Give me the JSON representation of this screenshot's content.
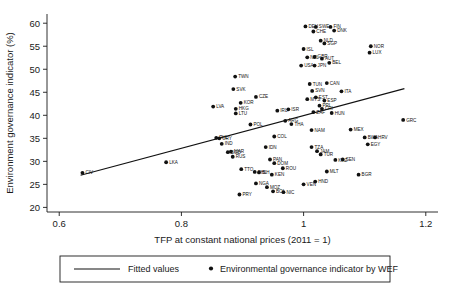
{
  "chart_data": {
    "type": "scatter",
    "title": "",
    "xlabel": "TFP at constant national prices (2011 = 1)",
    "ylabel": "Environment governance indicator (%)",
    "xlim": [
      0.58,
      1.22
    ],
    "ylim": [
      19,
      62
    ],
    "xticks": [
      "0.6",
      "0.8",
      "1",
      "1.2"
    ],
    "xtick_values": [
      0.6,
      0.8,
      1.0,
      1.2
    ],
    "yticks": [
      "20",
      "25",
      "30",
      "35",
      "40",
      "45",
      "50",
      "55",
      "60"
    ],
    "ytick_values": [
      20,
      25,
      30,
      35,
      40,
      45,
      50,
      55,
      60
    ],
    "grid": false,
    "legend_position": "below",
    "legend": [
      {
        "marker": "line",
        "label": "Fitted values"
      },
      {
        "marker": "dot",
        "label": "Environmental governance indicator by WEF"
      }
    ],
    "fitted_line": {
      "x0": 0.635,
      "y0": 27.0,
      "x1": 1.165,
      "y1": 45.8
    },
    "points": [
      {
        "label": "CIV",
        "x": 0.638,
        "y": 27.5,
        "dx": 3,
        "dy": 1.6
      },
      {
        "label": "LKA",
        "x": 0.775,
        "y": 29.8,
        "dx": 3,
        "dy": 1.6
      },
      {
        "label": "LVA",
        "x": 0.852,
        "y": 41.9,
        "dx": 3,
        "dy": 1.6
      },
      {
        "label": "TWN",
        "x": 0.888,
        "y": 48.4,
        "dx": 3,
        "dy": 1.6
      },
      {
        "label": "SVK",
        "x": 0.885,
        "y": 45.7,
        "dx": 3,
        "dy": 1.6
      },
      {
        "label": "CZE",
        "x": 0.922,
        "y": 44.0,
        "dx": 3,
        "dy": 1.6
      },
      {
        "label": "KOR",
        "x": 0.897,
        "y": 42.7,
        "dx": 3,
        "dy": 1.6
      },
      {
        "label": "HKG",
        "x": 0.889,
        "y": 41.4,
        "dx": 3,
        "dy": 1.6
      },
      {
        "label": "LTU",
        "x": 0.889,
        "y": 40.4,
        "dx": 3,
        "dy": 1.6
      },
      {
        "label": "POL",
        "x": 0.913,
        "y": 38.0,
        "dx": 3,
        "dy": 1.6
      },
      {
        "label": "URY",
        "x": 0.862,
        "y": 35.0,
        "dx": 3,
        "dy": 1.6
      },
      {
        "label": "PHL",
        "x": 0.857,
        "y": 35.1,
        "dx": 3,
        "dy": 1.6
      },
      {
        "label": "IND",
        "x": 0.866,
        "y": 33.8,
        "dx": 3,
        "dy": 1.6
      },
      {
        "label": "MAR",
        "x": 0.881,
        "y": 32.1,
        "dx": 3,
        "dy": 1.6
      },
      {
        "label": "BGD",
        "x": 0.876,
        "y": 32.0,
        "dx": 3,
        "dy": 1.6
      },
      {
        "label": "RUS",
        "x": 0.884,
        "y": 31.0,
        "dx": 3,
        "dy": 1.6
      },
      {
        "label": "TTO",
        "x": 0.898,
        "y": 28.3,
        "dx": 3,
        "dy": 1.6
      },
      {
        "label": "PHL2",
        "x": 0.92,
        "y": 27.7,
        "dx": 3,
        "dy": 1.6
      },
      {
        "label": "BIH",
        "x": 0.927,
        "y": 27.6,
        "dx": 3,
        "dy": 1.6
      },
      {
        "label": "NGA",
        "x": 0.922,
        "y": 25.2,
        "dx": 3,
        "dy": 1.6
      },
      {
        "label": "MOZ",
        "x": 0.94,
        "y": 24.4,
        "dx": 3,
        "dy": 1.6
      },
      {
        "label": "PRY",
        "x": 0.895,
        "y": 22.8,
        "dx": 3,
        "dy": 1.6
      },
      {
        "label": "BOL",
        "x": 0.95,
        "y": 23.5,
        "dx": 3,
        "dy": 1.6
      },
      {
        "label": "NIC",
        "x": 0.967,
        "y": 23.3,
        "dx": 3,
        "dy": 1.6
      },
      {
        "label": "IDN",
        "x": 0.938,
        "y": 33.1,
        "dx": 3,
        "dy": 1.6
      },
      {
        "label": "COL",
        "x": 0.952,
        "y": 35.4,
        "dx": 3,
        "dy": 1.6
      },
      {
        "label": "PAN",
        "x": 0.945,
        "y": 30.4,
        "dx": 3,
        "dy": 1.6
      },
      {
        "label": "DOM",
        "x": 0.952,
        "y": 29.6,
        "dx": 3,
        "dy": 1.6
      },
      {
        "label": "ROU",
        "x": 0.966,
        "y": 28.5,
        "dx": 3,
        "dy": 1.6
      },
      {
        "label": "KEN",
        "x": 0.948,
        "y": 27.1,
        "dx": 3,
        "dy": 1.6
      },
      {
        "label": "IRL",
        "x": 0.957,
        "y": 41.0,
        "dx": 3,
        "dy": 1.6
      },
      {
        "label": "ISR",
        "x": 0.975,
        "y": 41.3,
        "dx": 3,
        "dy": 1.6
      },
      {
        "label": "ARG",
        "x": 0.97,
        "y": 38.8,
        "dx": 3,
        "dy": 1.6
      },
      {
        "label": "THA",
        "x": 0.98,
        "y": 38.1,
        "dx": 3,
        "dy": 1.6
      },
      {
        "label": "TUN",
        "x": 1.01,
        "y": 46.8,
        "dx": 3,
        "dy": 1.6
      },
      {
        "label": "CAN",
        "x": 1.038,
        "y": 47.0,
        "dx": 3,
        "dy": 1.6
      },
      {
        "label": "SVN",
        "x": 1.014,
        "y": 45.3,
        "dx": 3,
        "dy": 1.6
      },
      {
        "label": "ITA",
        "x": 1.062,
        "y": 45.2,
        "dx": 3,
        "dy": 1.6
      },
      {
        "label": "MYS",
        "x": 1.006,
        "y": 43.5,
        "dx": 3,
        "dy": 1.6
      },
      {
        "label": "EST",
        "x": 1.02,
        "y": 43.9,
        "dx": 3,
        "dy": 1.6
      },
      {
        "label": "ESP",
        "x": 1.034,
        "y": 43.2,
        "dx": 3,
        "dy": 1.6
      },
      {
        "label": "PRI",
        "x": 1.026,
        "y": 42.1,
        "dx": 3,
        "dy": 1.6
      },
      {
        "label": "CRI",
        "x": 1.03,
        "y": 41.4,
        "dx": 3,
        "dy": 1.6
      },
      {
        "label": "HUN",
        "x": 1.046,
        "y": 40.5,
        "dx": 3,
        "dy": 1.6
      },
      {
        "label": "ZAF",
        "x": 1.016,
        "y": 40.7,
        "dx": 3,
        "dy": 1.6
      },
      {
        "label": "NAM",
        "x": 1.013,
        "y": 36.8,
        "dx": 3,
        "dy": 1.6
      },
      {
        "label": "MEX",
        "x": 1.077,
        "y": 36.9,
        "dx": 3,
        "dy": 1.6
      },
      {
        "label": "TZA",
        "x": 1.013,
        "y": 33.1,
        "dx": 3,
        "dy": 1.6
      },
      {
        "label": "JAM",
        "x": 1.022,
        "y": 32.2,
        "dx": 3,
        "dy": 1.6
      },
      {
        "label": "TUR",
        "x": 1.028,
        "y": 31.5,
        "dx": 3,
        "dy": 1.6
      },
      {
        "label": "KAZ",
        "x": 1.052,
        "y": 30.3,
        "dx": 3,
        "dy": 1.6
      },
      {
        "label": "SEN",
        "x": 1.064,
        "y": 30.4,
        "dx": 3,
        "dy": 1.6
      },
      {
        "label": "MLT",
        "x": 1.038,
        "y": 27.8,
        "dx": 3,
        "dy": 1.6
      },
      {
        "label": "BGR",
        "x": 1.09,
        "y": 27.1,
        "dx": 3,
        "dy": 1.6
      },
      {
        "label": "VEN",
        "x": 1.0,
        "y": 25.0,
        "dx": 3,
        "dy": 1.6
      },
      {
        "label": "HND",
        "x": 1.019,
        "y": 25.6,
        "dx": 3,
        "dy": 1.6
      },
      {
        "label": "BWA",
        "x": 1.1,
        "y": 35.2,
        "dx": 3,
        "dy": 1.6
      },
      {
        "label": "HRV",
        "x": 1.117,
        "y": 35.2,
        "dx": 3,
        "dy": 1.6
      },
      {
        "label": "EGY",
        "x": 1.105,
        "y": 33.7,
        "dx": 3,
        "dy": 1.6
      },
      {
        "label": "GRC",
        "x": 1.163,
        "y": 39.0,
        "dx": 3,
        "dy": 1.6
      },
      {
        "label": "DEU",
        "x": 1.003,
        "y": 59.3,
        "dx": 3,
        "dy": 1.6
      },
      {
        "label": "SWE",
        "x": 1.02,
        "y": 59.2,
        "dx": 3,
        "dy": 1.6
      },
      {
        "label": "CHE",
        "x": 1.016,
        "y": 58.2,
        "dx": 3,
        "dy": 1.6
      },
      {
        "label": "FIN",
        "x": 1.044,
        "y": 59.2,
        "dx": 3,
        "dy": 1.6
      },
      {
        "label": "DNK",
        "x": 1.05,
        "y": 58.4,
        "dx": 3,
        "dy": 1.6
      },
      {
        "label": "NLD",
        "x": 1.028,
        "y": 56.2,
        "dx": 3,
        "dy": 1.6
      },
      {
        "label": "SGP",
        "x": 1.034,
        "y": 55.6,
        "dx": 3,
        "dy": 1.6
      },
      {
        "label": "NOR",
        "x": 1.11,
        "y": 55.0,
        "dx": 3,
        "dy": 1.6
      },
      {
        "label": "LUX",
        "x": 1.108,
        "y": 53.6,
        "dx": 3,
        "dy": 1.6
      },
      {
        "label": "ISL",
        "x": 1.0,
        "y": 54.4,
        "dx": 3,
        "dy": 1.6
      },
      {
        "label": "NZL",
        "x": 1.006,
        "y": 52.6,
        "dx": 3,
        "dy": 1.6
      },
      {
        "label": "GBR",
        "x": 1.018,
        "y": 52.7,
        "dx": 3,
        "dy": 1.6
      },
      {
        "label": "AUT",
        "x": 1.03,
        "y": 52.3,
        "dx": 3,
        "dy": 1.6
      },
      {
        "label": "BEL",
        "x": 1.042,
        "y": 51.4,
        "dx": 3,
        "dy": 1.6
      },
      {
        "label": "USA",
        "x": 0.996,
        "y": 50.8,
        "dx": 3,
        "dy": 1.6
      },
      {
        "label": "JPN",
        "x": 1.018,
        "y": 50.8,
        "dx": 3,
        "dy": 1.6
      }
    ]
  }
}
